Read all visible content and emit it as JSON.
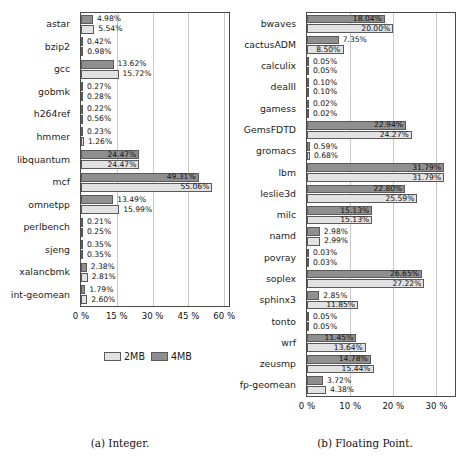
{
  "figure": {
    "legend": {
      "series_2mb": "2MB",
      "series_4mb": "4MB",
      "color_2mb": "#e2e2e2",
      "color_4mb": "#8f8f8f"
    },
    "captions": {
      "integer": "(a) Integer.",
      "floating_point": "(b) Floating Point."
    }
  },
  "chart_data": [
    {
      "type": "bar",
      "orientation": "horizontal",
      "title": "(a) Integer.",
      "xlabel": "",
      "ylabel": "",
      "xlim": [
        0,
        62
      ],
      "xticks": [
        0,
        15,
        30,
        45,
        60
      ],
      "xtick_labels": [
        "0 %",
        "15 %",
        "30 %",
        "45 %",
        "60 %"
      ],
      "grid": true,
      "legend_position": "below-center",
      "categories": [
        "astar",
        "bzip2",
        "gcc",
        "gobmk",
        "h264ref",
        "hmmer",
        "libquantum",
        "mcf",
        "omnetpp",
        "perlbench",
        "sjeng",
        "xalancbmk",
        "int-geomean"
      ],
      "series": [
        {
          "name": "4MB",
          "color": "#8f8f8f",
          "values": [
            4.98,
            0.42,
            13.62,
            0.27,
            0.22,
            0.23,
            24.47,
            49.31,
            13.49,
            0.21,
            0.35,
            2.38,
            1.79
          ],
          "labels": [
            "4.98%",
            "0.42%",
            "13.62%",
            "0.27%",
            "0.22%",
            "0.23%",
            "24.47%",
            "49.31%",
            "13.49%",
            "0.21%",
            "0.35%",
            "2.38%",
            "1.79%"
          ]
        },
        {
          "name": "2MB",
          "color": "#e2e2e2",
          "values": [
            5.54,
            0.98,
            15.72,
            0.28,
            0.56,
            1.26,
            24.47,
            55.06,
            15.99,
            0.25,
            0.35,
            2.81,
            2.6
          ],
          "labels": [
            "5.54%",
            "0.98%",
            "15.72%",
            "0.28%",
            "0.56%",
            "1.26%",
            "24.47%",
            "55.06%",
            "15.99%",
            "0.25%",
            "0.35%",
            "2.81%",
            "2.60%"
          ]
        }
      ]
    },
    {
      "type": "bar",
      "orientation": "horizontal",
      "title": "(b) Floating Point.",
      "xlabel": "",
      "ylabel": "",
      "xlim": [
        0,
        34.3
      ],
      "xticks": [
        0,
        10,
        20,
        30
      ],
      "xtick_labels": [
        "0 %",
        "10 %",
        "20 %",
        "30 %"
      ],
      "grid": true,
      "legend_position": "shared",
      "categories": [
        "bwaves",
        "cactusADM",
        "calculix",
        "dealII",
        "gamess",
        "GemsFDTD",
        "gromacs",
        "lbm",
        "leslie3d",
        "milc",
        "namd",
        "povray",
        "soplex",
        "sphinx3",
        "tonto",
        "wrf",
        "zeusmp",
        "fp-geomean"
      ],
      "series": [
        {
          "name": "4MB",
          "color": "#8f8f8f",
          "values": [
            18.04,
            7.35,
            0.05,
            0.1,
            0.02,
            22.94,
            0.59,
            31.79,
            22.8,
            15.13,
            2.98,
            0.03,
            26.65,
            2.85,
            0.05,
            11.45,
            14.78,
            3.72
          ],
          "labels": [
            "18.04%",
            "7.35%",
            "0.05%",
            "0.10%",
            "0.02%",
            "22.94%",
            "0.59%",
            "31.79%",
            "22.80%",
            "15.13%",
            "2.98%",
            "0.03%",
            "26.65%",
            "2.85%",
            "0.05%",
            "11.45%",
            "14.78%",
            "3.72%"
          ]
        },
        {
          "name": "2MB",
          "color": "#e2e2e2",
          "values": [
            20.0,
            8.5,
            0.05,
            0.1,
            0.02,
            24.27,
            0.68,
            31.79,
            25.59,
            15.13,
            2.99,
            0.03,
            27.22,
            11.85,
            0.05,
            13.64,
            15.44,
            4.38
          ],
          "labels": [
            "20.00%",
            "8.50%",
            "0.05%",
            "0.10%",
            "0.02%",
            "24.27%",
            "0.68%",
            "31.79%",
            "25.59%",
            "15.13%",
            "2.99%",
            "0.03%",
            "27.22%",
            "11.85%",
            "0.05%",
            "13.64%",
            "15.44%",
            "4.38%"
          ]
        }
      ]
    }
  ]
}
